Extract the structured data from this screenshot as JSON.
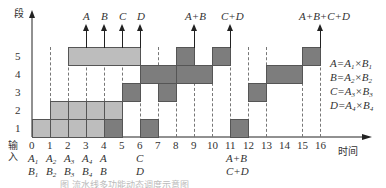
{
  "y_axis": {
    "label": "段",
    "stages": [
      "1",
      "2",
      "3",
      "4",
      "5"
    ]
  },
  "x_axis": {
    "label": "时间",
    "ticks": [
      "0",
      "1",
      "2",
      "3",
      "4",
      "5",
      "6",
      "7",
      "8",
      "9",
      "10",
      "11",
      "12",
      "13",
      "14",
      "15",
      "16"
    ]
  },
  "input_label": "输\n入",
  "input_row1": [
    {
      "t": 0,
      "text": "A",
      "sub": "1"
    },
    {
      "t": 1,
      "text": "A",
      "sub": "2"
    },
    {
      "t": 2,
      "text": "A",
      "sub": "3"
    },
    {
      "t": 3,
      "text": "A",
      "sub": "4"
    },
    {
      "t": 4,
      "text": "A",
      "sub": ""
    },
    {
      "t": 6,
      "text": "C",
      "sub": ""
    },
    {
      "t": 11,
      "text": "A+B",
      "sub": ""
    }
  ],
  "input_row2": [
    {
      "t": 0,
      "text": "B",
      "sub": "1"
    },
    {
      "t": 1,
      "text": "B",
      "sub": "2"
    },
    {
      "t": 2,
      "text": "B",
      "sub": "3"
    },
    {
      "t": 3,
      "text": "B",
      "sub": "4"
    },
    {
      "t": 4,
      "text": "B",
      "sub": ""
    },
    {
      "t": 6,
      "text": "D",
      "sub": ""
    },
    {
      "t": 11,
      "text": "C+D",
      "sub": ""
    }
  ],
  "outputs": [
    {
      "t": 3,
      "text": "A"
    },
    {
      "t": 4,
      "text": "B"
    },
    {
      "t": 5,
      "text": "C"
    },
    {
      "t": 6,
      "text": "D"
    },
    {
      "t": 9,
      "text": "A+B"
    },
    {
      "t": 11,
      "text": "C+D"
    },
    {
      "t": 16,
      "text": "A+B+C+D"
    }
  ],
  "legend": [
    {
      "lhs": "A",
      "a": "A",
      "as": "1",
      "b": "B",
      "bs": "1"
    },
    {
      "lhs": "B",
      "a": "A",
      "as": "2",
      "b": "B",
      "bs": "2"
    },
    {
      "lhs": "C",
      "a": "A",
      "as": "3",
      "b": "B",
      "bs": "3"
    },
    {
      "lhs": "D",
      "a": "A",
      "as": "4",
      "b": "B",
      "bs": "4"
    }
  ],
  "blocks": [
    {
      "stage": 1,
      "start": 0,
      "end": 1,
      "shade": "light"
    },
    {
      "stage": 1,
      "start": 1,
      "end": 2,
      "shade": "light"
    },
    {
      "stage": 1,
      "start": 2,
      "end": 3,
      "shade": "light"
    },
    {
      "stage": 1,
      "start": 3,
      "end": 4,
      "shade": "light"
    },
    {
      "stage": 1,
      "start": 4,
      "end": 5,
      "shade": "dark"
    },
    {
      "stage": 1,
      "start": 6,
      "end": 7,
      "shade": "dark"
    },
    {
      "stage": 1,
      "start": 11,
      "end": 12,
      "shade": "dark"
    },
    {
      "stage": 2,
      "start": 1,
      "end": 2,
      "shade": "light"
    },
    {
      "stage": 2,
      "start": 2,
      "end": 3,
      "shade": "light"
    },
    {
      "stage": 2,
      "start": 3,
      "end": 4,
      "shade": "light"
    },
    {
      "stage": 2,
      "start": 4,
      "end": 5,
      "shade": "light"
    },
    {
      "stage": 3,
      "start": 5,
      "end": 6,
      "shade": "dark"
    },
    {
      "stage": 3,
      "start": 7,
      "end": 8,
      "shade": "dark"
    },
    {
      "stage": 3,
      "start": 12,
      "end": 13,
      "shade": "dark"
    },
    {
      "stage": 4,
      "start": 6,
      "end": 8,
      "shade": "dark"
    },
    {
      "stage": 4,
      "start": 8,
      "end": 10,
      "shade": "dark"
    },
    {
      "stage": 4,
      "start": 13,
      "end": 15,
      "shade": "dark"
    },
    {
      "stage": 5,
      "start": 2,
      "end": 6,
      "shade": "light"
    },
    {
      "stage": 5,
      "start": 8,
      "end": 9,
      "shade": "dark"
    },
    {
      "stage": 5,
      "start": 10,
      "end": 11,
      "shade": "dark"
    },
    {
      "stage": 5,
      "start": 15,
      "end": 16,
      "shade": "dark"
    }
  ],
  "dashed_at": [
    1,
    2,
    3,
    4,
    5,
    6,
    7,
    8,
    9,
    10,
    11,
    12,
    13,
    15,
    16
  ],
  "caption": "图 流水线多功能动态调度示意图"
}
